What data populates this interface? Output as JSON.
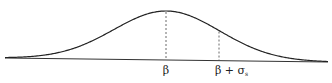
{
  "diagram": {
    "type": "gaussian-curve",
    "curve_color": "#222222",
    "markers": [
      {
        "id": "mean",
        "label_main": "β",
        "label_sub": "",
        "offset_sigma": 0
      },
      {
        "id": "mean-plus-sigma",
        "label_main": "β + σ",
        "label_sub": "s",
        "offset_sigma": 1
      }
    ]
  }
}
